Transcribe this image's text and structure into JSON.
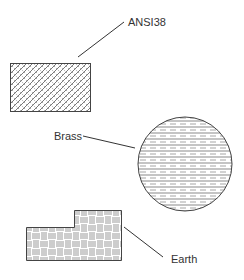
{
  "labels": {
    "ansi38": "ANSI38",
    "brass": "Brass",
    "earth": "Earth"
  },
  "colors": {
    "stroke": "#444444",
    "background": "#ffffff"
  },
  "shapes": [
    {
      "name": "ANSI38",
      "type": "rectangle",
      "pattern": "crosshatch"
    },
    {
      "name": "Brass",
      "type": "circle",
      "pattern": "horizontal-dashed-lines"
    },
    {
      "name": "Earth",
      "type": "stepped-polygon",
      "pattern": "basketweave"
    }
  ]
}
